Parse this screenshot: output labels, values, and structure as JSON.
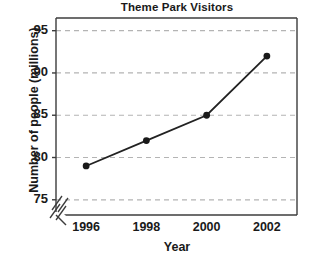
{
  "chart_data": {
    "type": "line",
    "title": "Theme Park Visitors",
    "xlabel": "Year",
    "ylabel": "Number of people (millions)",
    "x": [
      1996,
      1998,
      2000,
      2002
    ],
    "values": [
      79,
      82,
      85,
      92
    ],
    "x_tick_labels": [
      "1996",
      "1998",
      "2000",
      "2002"
    ],
    "y_tick_labels": [
      "75",
      "80",
      "85",
      "90",
      "95"
    ],
    "y_ticks": [
      75,
      80,
      85,
      90,
      95
    ],
    "xlim": [
      1995,
      2003
    ],
    "ylim": [
      73.2,
      96.5
    ],
    "grid": true,
    "grid_axis": "y",
    "grid_style": "dashed",
    "legend": false,
    "axis_break": true,
    "axis_break_note": "double slash break marks on both axes near origin",
    "marker": "filled-circle",
    "colors": {
      "line": "#222222",
      "marker": "#1a1a1a",
      "grid": "#b4b4b4",
      "axis": "#3c3c3c",
      "text": "#1a1a1a",
      "background": "#ffffff"
    }
  }
}
